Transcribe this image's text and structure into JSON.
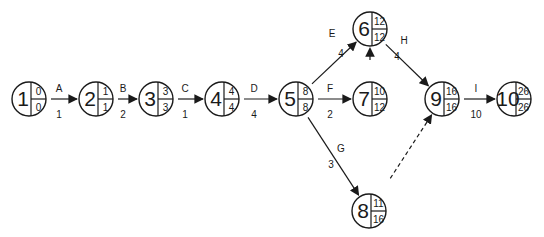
{
  "diagram": {
    "type": "activity-on-arrow network (CPM)",
    "nodes": [
      {
        "id": "1",
        "x": 29,
        "y": 99,
        "early": "0",
        "late": "0"
      },
      {
        "id": "2",
        "x": 96,
        "y": 99,
        "early": "1",
        "late": "1"
      },
      {
        "id": "3",
        "x": 156,
        "y": 99,
        "early": "3",
        "late": "3"
      },
      {
        "id": "4",
        "x": 222,
        "y": 99,
        "early": "4",
        "late": "4"
      },
      {
        "id": "5",
        "x": 296,
        "y": 99,
        "early": "8",
        "late": "8"
      },
      {
        "id": "6",
        "x": 370,
        "y": 29,
        "early": "12",
        "late": "12"
      },
      {
        "id": "7",
        "x": 370,
        "y": 99,
        "early": "10",
        "late": "12"
      },
      {
        "id": "8",
        "x": 369,
        "y": 211,
        "early": "11",
        "late": "16"
      },
      {
        "id": "9",
        "x": 442,
        "y": 99,
        "early": "16",
        "late": "16"
      },
      {
        "id": "10",
        "x": 514,
        "y": 99,
        "early": "26",
        "late": "26"
      }
    ],
    "edges": [
      {
        "from": "1",
        "to": "2",
        "activity": "A",
        "duration": "1",
        "dashed": false,
        "lx": 59,
        "ly": 92,
        "dx": 59,
        "dy": 118
      },
      {
        "from": "2",
        "to": "3",
        "activity": "B",
        "duration": "2",
        "dashed": false,
        "lx": 123,
        "ly": 92,
        "dx": 123,
        "dy": 118
      },
      {
        "from": "3",
        "to": "4",
        "activity": "C",
        "duration": "1",
        "dashed": false,
        "lx": 185,
        "ly": 92,
        "dx": 185,
        "dy": 118
      },
      {
        "from": "4",
        "to": "5",
        "activity": "D",
        "duration": "4",
        "dashed": false,
        "lx": 254,
        "ly": 92,
        "dx": 254,
        "dy": 118
      },
      {
        "from": "5",
        "to": "6",
        "activity": "E",
        "duration": "4",
        "dashed": false,
        "lx": 332,
        "ly": 37,
        "dx": 341,
        "dy": 57
      },
      {
        "from": "5",
        "to": "7",
        "activity": "F",
        "duration": "2",
        "dashed": false,
        "lx": 330,
        "ly": 92,
        "dx": 330,
        "dy": 118
      },
      {
        "from": "5",
        "to": "8",
        "activity": "G",
        "duration": "3",
        "dashed": false,
        "lx": 341,
        "ly": 152,
        "dx": 331,
        "dy": 168
      },
      {
        "from": "7",
        "to": "6",
        "activity": "",
        "duration": "",
        "dashed": true,
        "lx": 0,
        "ly": 0,
        "dx": 0,
        "dy": 0
      },
      {
        "from": "6",
        "to": "9",
        "activity": "H",
        "duration": "4",
        "dashed": false,
        "lx": 404,
        "ly": 44,
        "dx": 397,
        "dy": 60
      },
      {
        "from": "8",
        "to": "9",
        "activity": "",
        "duration": "",
        "dashed": true,
        "lx": 0,
        "ly": 0,
        "dx": 0,
        "dy": 0
      },
      {
        "from": "9",
        "to": "10",
        "activity": "I",
        "duration": "10",
        "dashed": false,
        "lx": 476,
        "ly": 92,
        "dx": 476,
        "dy": 118
      }
    ],
    "colors": {
      "stroke": "#1a1a1a",
      "background": "#ffffff"
    }
  }
}
